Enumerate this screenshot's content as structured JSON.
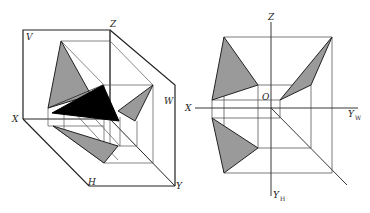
{
  "figure": {
    "colors": {
      "line": "#222222",
      "thin_line": "#444444",
      "face_gray": "#9a9a9a",
      "face_dark": "#000000",
      "background": "#ffffff"
    },
    "left_view": {
      "labels": {
        "v_plane": "V",
        "z_axis": "Z",
        "w_plane": "W",
        "x_axis": "X",
        "h_plane": "H",
        "y_axis": "Y"
      }
    },
    "right_view": {
      "labels": {
        "z_axis": "Z",
        "origin": "O",
        "x_axis": "X",
        "y_w": "Y",
        "y_w_sub": "W",
        "y_h": "Y",
        "y_h_sub": "H"
      }
    }
  }
}
